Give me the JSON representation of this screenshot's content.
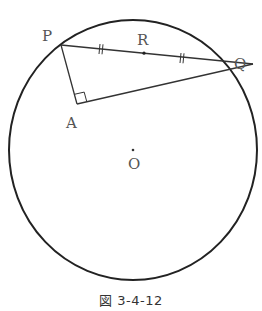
{
  "figure": {
    "caption": "図 3-4-12",
    "colors": {
      "circle": "#222222",
      "segments": "#333333",
      "labels": "#555555"
    },
    "circle": {
      "center_label": "O",
      "cx": 133,
      "cy": 150,
      "rx": 124,
      "ry": 130
    },
    "points": {
      "P": {
        "label": "P",
        "x": 61,
        "y": 45
      },
      "Q": {
        "label": "Q",
        "x": 253,
        "y": 64
      },
      "A": {
        "label": "A",
        "x": 77,
        "y": 104
      },
      "R": {
        "label": "R",
        "x": 144,
        "y": 55
      },
      "O": {
        "label": "O",
        "x": 133,
        "y": 150
      }
    },
    "segments": [
      "PQ",
      "PA",
      "AQ"
    ],
    "annotations": {
      "right_angle_at": "A",
      "equal_marks": [
        "PR",
        "RQ"
      ]
    }
  }
}
